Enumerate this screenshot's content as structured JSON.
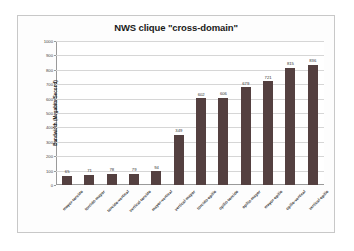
{
  "chart_data": {
    "type": "bar",
    "title": "NWS clique \"cross-domain\"",
    "xlabel": "",
    "ylabel": "Bandwidth (Megabits/Second)",
    "ylim": [
      0,
      1000
    ],
    "yticks": [
      0,
      100,
      200,
      300,
      400,
      500,
      600,
      700,
      800,
      900,
      1000
    ],
    "grid": true,
    "legend": false,
    "bar_color": "#544040",
    "categories": [
      "mayor-torcido",
      "torcido-mayor",
      "torcido-vertical",
      "vertical-torcido",
      "mayor-vertical",
      "vertical-mayor",
      "torcido-opilio",
      "opilio-torcido",
      "opilio-mayor",
      "mayor-opilio",
      "opilio-vertical",
      "vertical-opilio"
    ],
    "values": [
      65,
      71,
      78,
      79,
      94,
      349,
      602,
      606,
      679,
      721,
      815,
      836
    ],
    "data_labels": [
      "65",
      "71",
      "78",
      "79",
      "94",
      "349",
      "602",
      "606",
      "679",
      "721",
      "815",
      "836"
    ],
    "ytick_labels": [
      "0",
      "100",
      "200",
      "300",
      "400",
      "500",
      "600",
      "700",
      "800",
      "900",
      "1000"
    ]
  }
}
